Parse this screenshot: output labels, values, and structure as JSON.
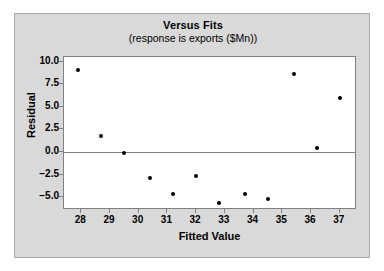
{
  "chart_data": {
    "type": "scatter",
    "title": "Versus Fits",
    "subtitle": "(response is exports ($Mn))",
    "xlabel": "Fitted Value",
    "ylabel": "Residual",
    "xlim": [
      27.4,
      37.6
    ],
    "ylim": [
      -6.4,
      10.5
    ],
    "xticks": [
      28,
      29,
      30,
      31,
      32,
      33,
      34,
      35,
      36,
      37
    ],
    "xtick_labels": [
      "28",
      "29",
      "30",
      "31",
      "32",
      "33",
      "34",
      "35",
      "36",
      "37"
    ],
    "yticks": [
      10.0,
      7.5,
      5.0,
      2.5,
      0.0,
      -2.5,
      -5.0
    ],
    "ytick_labels": [
      "10.0",
      "7.5",
      "5.0",
      "2.5",
      "0.0",
      "−2.5",
      "−5.0"
    ],
    "grid": false,
    "legend": false,
    "reference_line": {
      "axis": "y",
      "value": 0.0,
      "color": "#808080"
    },
    "marker": {
      "shape": "circle",
      "color": "#000000",
      "size": 4
    },
    "points": [
      {
        "x": 27.9,
        "y": 9.1
      },
      {
        "x": 28.7,
        "y": 1.8
      },
      {
        "x": 29.5,
        "y": -0.1
      },
      {
        "x": 30.4,
        "y": -2.9
      },
      {
        "x": 31.2,
        "y": -4.6
      },
      {
        "x": 32.0,
        "y": -2.6
      },
      {
        "x": 32.8,
        "y": -5.6
      },
      {
        "x": 33.7,
        "y": -4.6
      },
      {
        "x": 34.5,
        "y": -5.2
      },
      {
        "x": 35.4,
        "y": 8.6
      },
      {
        "x": 36.2,
        "y": 0.5
      },
      {
        "x": 37.0,
        "y": 6.0
      }
    ]
  },
  "colors": {
    "figure_background": "#d9d9d9",
    "plot_background": "#ffffff",
    "axis": "#808080",
    "text": "#000000",
    "marker": "#000000"
  }
}
